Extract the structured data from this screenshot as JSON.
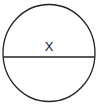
{
  "diagram": {
    "shape": "circle",
    "label": "X",
    "stroke_color": "#222222",
    "background": "#ffffff",
    "has_diameter_line": true
  }
}
